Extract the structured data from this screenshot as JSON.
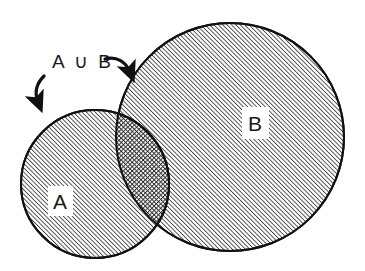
{
  "figure": {
    "type": "venn-diagram",
    "background_color": "#ffffff",
    "stroke_color": "#111111",
    "hatch_color": "#4a4a4a",
    "annotation": {
      "text": "A ∪ B",
      "x": 52,
      "y": 66
    },
    "sets": [
      {
        "id": "A",
        "label": "A",
        "cx": 95,
        "cy": 184,
        "r": 74,
        "fill_pattern": "diagonal-hatch",
        "label_x": 60,
        "label_y": 207,
        "label_box": {
          "x": 48,
          "y": 186,
          "w": 25,
          "h": 30
        }
      },
      {
        "id": "B",
        "label": "B",
        "cx": 230,
        "cy": 137,
        "r": 114,
        "fill_pattern": "diagonal-hatch",
        "label_x": 248,
        "label_y": 130,
        "label_box": {
          "x": 242,
          "y": 107,
          "w": 27,
          "h": 32
        }
      }
    ],
    "intersection": {
      "label": "",
      "fill_pattern": "cross-hatch-dark"
    },
    "arrows": [
      {
        "name": "arrow-to-set-a",
        "direction": "down-left"
      },
      {
        "name": "arrow-to-set-b",
        "direction": "down-right"
      }
    ]
  }
}
